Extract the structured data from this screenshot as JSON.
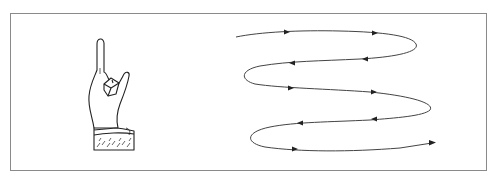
{
  "figure": {
    "description": "Hand with raised index finger beside a zig-zag looping path with direction arrows",
    "frame_color": "#8a8a8a",
    "line_color": "#333333",
    "hand": {
      "icon": "pointing-up-hand-icon",
      "gesture": "index finger raised"
    },
    "path": {
      "type": "serpentine-loop",
      "rows": 5,
      "arrows": [
        {
          "x": 287,
          "y": 32,
          "dir": "right"
        },
        {
          "x": 375,
          "y": 33,
          "dir": "right"
        },
        {
          "x": 365,
          "y": 59,
          "dir": "left"
        },
        {
          "x": 292,
          "y": 63,
          "dir": "left"
        },
        {
          "x": 291,
          "y": 88,
          "dir": "right"
        },
        {
          "x": 374,
          "y": 92,
          "dir": "right"
        },
        {
          "x": 374,
          "y": 119,
          "dir": "left"
        },
        {
          "x": 300,
          "y": 123,
          "dir": "left"
        },
        {
          "x": 295,
          "y": 149,
          "dir": "right"
        },
        {
          "x": 432,
          "y": 143,
          "dir": "right"
        }
      ]
    }
  }
}
